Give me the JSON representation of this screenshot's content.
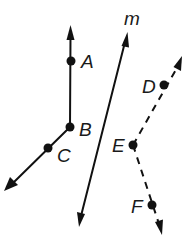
{
  "diagram": {
    "width": 196,
    "height": 242,
    "color": "#111111",
    "points": [
      {
        "id": "A",
        "label": "A",
        "x": 71,
        "y": 61
      },
      {
        "id": "B",
        "label": "B",
        "x": 70,
        "y": 127
      },
      {
        "id": "C",
        "label": "C",
        "x": 48,
        "y": 148
      },
      {
        "id": "D",
        "label": "D",
        "x": 164,
        "y": 85
      },
      {
        "id": "E",
        "label": "E",
        "x": 133,
        "y": 145
      },
      {
        "id": "F",
        "label": "F",
        "x": 152,
        "y": 205
      }
    ],
    "lines": [
      {
        "id": "ray-BA",
        "style": "solid",
        "description": "Ray from B through A"
      },
      {
        "id": "ray-BC",
        "style": "solid",
        "description": "Ray from B through C"
      },
      {
        "id": "line-m",
        "label": "m",
        "style": "solid",
        "description": "Line m (arrows both ends)"
      },
      {
        "id": "ray-ED",
        "style": "dashed",
        "description": "Ray from E through D"
      },
      {
        "id": "ray-EF",
        "style": "dashed",
        "description": "Ray from E through F"
      }
    ],
    "labels": {
      "A": "A",
      "B": "B",
      "C": "C",
      "D": "D",
      "E": "E",
      "F": "F",
      "m": "m"
    }
  }
}
